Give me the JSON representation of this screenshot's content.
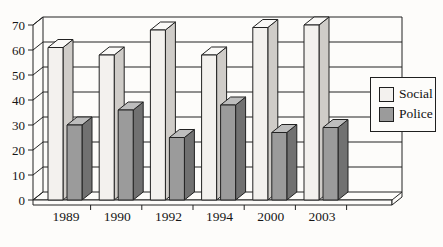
{
  "figure": {
    "background": "#fdfcfa",
    "line_color": "#222222"
  },
  "chart_data": {
    "type": "bar",
    "variant": "3d-clustered-column",
    "title": "",
    "xlabel": "",
    "ylabel": "",
    "categories": [
      "1989",
      "1990",
      "1992",
      "1994",
      "2000",
      "2003"
    ],
    "series": [
      {
        "name": "Social",
        "values": [
          61,
          58,
          68,
          58,
          69,
          70
        ],
        "fill": {
          "front": "#f3f1ee",
          "top": "#faf9f7",
          "side": "#cfccc8"
        }
      },
      {
        "name": "Police",
        "values": [
          30,
          36,
          25,
          38,
          27,
          29
        ],
        "fill": {
          "front": "#9b9b9b",
          "top": "#bdbdbd",
          "side": "#717171"
        }
      }
    ],
    "ylim": [
      0,
      70
    ],
    "ytick_step": 10,
    "grid": true,
    "legend_position": "right"
  }
}
